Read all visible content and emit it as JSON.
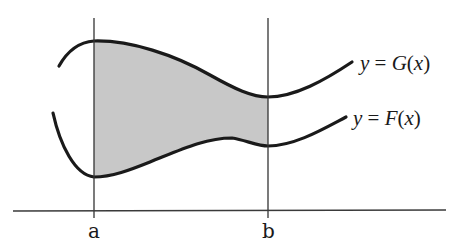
{
  "diagram": {
    "colors": {
      "shading": "#c8c8c8",
      "curves": "#1a1a1a",
      "lines": "#333333",
      "background": "#ffffff"
    },
    "labels": {
      "upper_curve": {
        "prefix": "y",
        "equals": " = ",
        "func": "G",
        "open": "(",
        "var": "x",
        "close": ")"
      },
      "lower_curve": {
        "prefix": "y",
        "equals": " = ",
        "func": "F",
        "open": "(",
        "var": "x",
        "close": ")"
      },
      "left_bound": "a",
      "right_bound": "b"
    },
    "elements": {
      "x_axis": "horizontal axis",
      "left_line": "vertical line at x = a",
      "right_line": "vertical line at x = b",
      "shaded_region": "region bounded by G(x) above, F(x) below, a on left, b on right"
    }
  }
}
